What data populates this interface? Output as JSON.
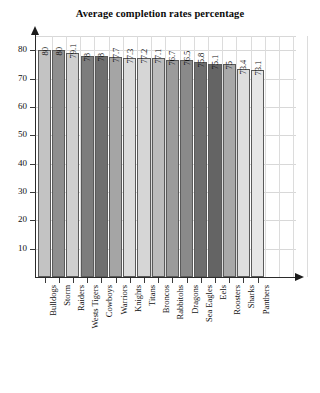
{
  "chart_data": {
    "type": "bar",
    "title": "Average completion rates percentage",
    "xlabel": "",
    "ylabel": "",
    "ylim": [
      0,
      85
    ],
    "ytick_labels": [
      "10",
      "20",
      "30",
      "40",
      "50",
      "60",
      "70",
      "80"
    ],
    "yticks": [
      10,
      20,
      30,
      40,
      50,
      60,
      70,
      80
    ],
    "grid": true,
    "legend": "none",
    "categories": [
      "Bulldogs",
      "Storm",
      "Raiders",
      "Wests Tigers",
      "Cowboys",
      "Warriors",
      "Knights",
      "Titans",
      "Broncos",
      "Rabbitohs",
      "Dragons",
      "Sea Eagles",
      "Eels",
      "Roosters",
      "Sharks",
      "Panthers"
    ],
    "values": [
      80,
      80,
      79.1,
      78,
      78,
      77.7,
      77.3,
      77.2,
      77.1,
      76.7,
      76.5,
      75.8,
      75.1,
      75,
      73.4,
      73.1
    ],
    "value_labels": [
      "80",
      "80",
      "79.1",
      "78",
      "78",
      "77.7",
      "77.3",
      "77.2",
      "77.1",
      "76.7",
      "76.5",
      "75.8",
      "75.1",
      "75",
      "73.4",
      "73.1"
    ],
    "bar_colors": [
      "#c3c3c3",
      "#8f8f8f",
      "#cfcfcf",
      "#7d7d7d",
      "#6f6f6f",
      "#a5a5a5",
      "#dcdcdc",
      "#d6d6d6",
      "#bcbcbc",
      "#9b9b9b",
      "#8a8a8a",
      "#6e6e6e",
      "#646464",
      "#a8a8a8",
      "#dedede",
      "#e6e6e6"
    ],
    "bar_edge_color": "#5a5a5a",
    "grid_color": "#d8d8d8",
    "axis_color": "#2b2b2b",
    "text_color": "#101010"
  }
}
